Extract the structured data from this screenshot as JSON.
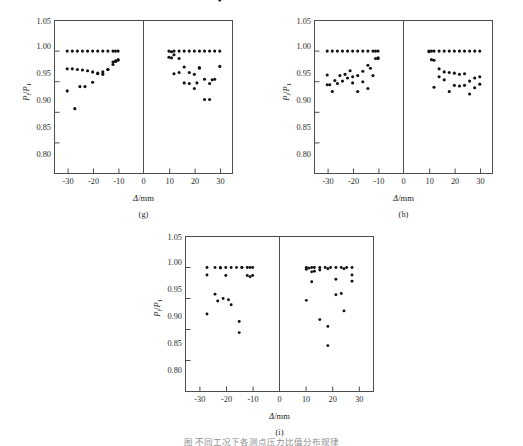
{
  "figure": {
    "panel_count": 3,
    "caption_partial": "图   不同工况下各测点压力比值分布规律"
  },
  "axes": {
    "ylabel": "P i / P 1",
    "ylabel_main": "P",
    "ylabel_sub_i": "i",
    "ylabel_den": "P",
    "ylabel_sub_1": "1",
    "xlabel_symbol": "Δ",
    "xlabel_unit": "/mm",
    "yticks": [
      "1.05",
      "1.00",
      "0.95",
      "0.90",
      "0.85",
      "0.80"
    ],
    "ytick_values": [
      1.05,
      1.0,
      0.95,
      0.9,
      0.85,
      0.8
    ],
    "xticks": [
      "-30",
      "-20",
      "-10",
      "0",
      "10",
      "20",
      "30"
    ],
    "xtick_values": [
      -30,
      -20,
      -10,
      0,
      10,
      20,
      30
    ],
    "ylim": [
      0.8,
      1.05
    ],
    "xlim": [
      -35,
      35
    ],
    "marker_color": "#111111",
    "frame_color": "#4d4d4d"
  },
  "chart_data": [
    {
      "type": "scatter",
      "panel": "(g)",
      "title": "",
      "xlabel": "Δ/mm",
      "ylabel": "Pi/P1",
      "xlim": [
        -35,
        35
      ],
      "ylim": [
        0.8,
        1.05
      ],
      "grid": false,
      "legend": "none",
      "x": [
        -30,
        -28,
        -26,
        -24,
        -22,
        -20,
        -18,
        -16,
        -14,
        -12,
        -11,
        -10,
        -30,
        -28,
        -26,
        -24,
        -22,
        -20,
        -18,
        -16,
        -14,
        -12,
        -11,
        -10,
        -30,
        -27,
        -25,
        -23,
        -20,
        -18,
        -16,
        -14,
        -12,
        -11,
        -10,
        10,
        11,
        12,
        14,
        16,
        18,
        20,
        22,
        24,
        26,
        28,
        30,
        10,
        11,
        12,
        14,
        16,
        18,
        20,
        22,
        24,
        26,
        28,
        30,
        12,
        14,
        16,
        18,
        20,
        21,
        22,
        24,
        26,
        27,
        30
      ],
      "y": [
        1.0,
        1.0,
        1.0,
        1.0,
        1.0,
        1.0,
        1.0,
        1.0,
        1.0,
        1.0,
        1.0,
        1.0,
        0.971,
        0.971,
        0.97,
        0.969,
        0.968,
        0.966,
        0.964,
        0.966,
        0.97,
        0.978,
        0.983,
        0.985,
        0.935,
        0.906,
        0.942,
        0.942,
        0.949,
        0.963,
        0.962,
        0.97,
        0.982,
        0.984,
        0.986,
        1.0,
        0.999,
        1.0,
        1.0,
        1.0,
        1.0,
        1.0,
        1.0,
        1.0,
        1.0,
        1.0,
        1.0,
        0.99,
        0.989,
        0.994,
        0.988,
        0.974,
        0.965,
        0.962,
        0.972,
        0.954,
        0.947,
        0.954,
        0.975,
        0.963,
        0.965,
        0.948,
        0.947,
        0.939,
        0.948,
        0.973,
        0.921,
        0.921,
        0.953
      ],
      "series_note": "three overlapping point bands per side"
    },
    {
      "type": "scatter",
      "panel": "(h)",
      "title": "",
      "xlabel": "Δ/mm",
      "ylabel": "Pi/P1",
      "xlim": [
        -35,
        35
      ],
      "ylim": [
        0.8,
        1.05
      ],
      "grid": false,
      "legend": "none",
      "x": [
        -30,
        -28,
        -26,
        -24,
        -22,
        -20,
        -18,
        -16,
        -14,
        -12,
        -11,
        -10,
        -30,
        -29,
        -27,
        -25,
        -23,
        -21,
        -20,
        -18,
        -16,
        -14,
        -13,
        -11,
        -10,
        -30,
        -28,
        -26,
        -24,
        -22,
        -20,
        -18,
        -16,
        -14,
        -12,
        -10,
        10,
        11,
        12,
        14,
        16,
        18,
        20,
        22,
        24,
        26,
        28,
        30,
        10,
        11,
        12,
        14,
        16,
        18,
        20,
        22,
        24,
        26,
        28,
        30,
        12,
        14,
        16,
        18,
        20,
        22,
        24,
        26,
        28,
        30
      ],
      "y": [
        1.0,
        1.0,
        1.0,
        1.0,
        1.0,
        1.0,
        1.0,
        1.0,
        1.0,
        1.0,
        1.0,
        1.0,
        0.961,
        0.945,
        0.952,
        0.96,
        0.962,
        0.968,
        0.958,
        0.96,
        0.967,
        0.977,
        0.972,
        0.988,
        0.989,
        0.945,
        0.934,
        0.947,
        0.951,
        0.956,
        0.948,
        0.934,
        0.95,
        0.939,
        0.96,
        0.988,
        1.0,
        1.0,
        1.0,
        1.0,
        1.0,
        1.0,
        1.0,
        1.0,
        1.0,
        1.0,
        1.0,
        1.0,
        0.999,
        0.986,
        0.985,
        0.971,
        0.966,
        0.965,
        0.964,
        0.962,
        0.963,
        0.951,
        0.956,
        0.958,
        0.941,
        0.958,
        0.953,
        0.934,
        0.944,
        0.943,
        0.944,
        0.93,
        0.94,
        0.946
      ],
      "series_note": "three overlapping point bands per side"
    },
    {
      "type": "scatter",
      "panel": "(i)",
      "title": "",
      "xlabel": "Δ/mm",
      "ylabel": "Pi/P1",
      "xlim": [
        -35,
        35
      ],
      "ylim": [
        0.8,
        1.05
      ],
      "grid": false,
      "legend": "none",
      "x": [
        -27,
        -24,
        -22,
        -20,
        -18,
        -16,
        -14,
        -12,
        -11,
        -10,
        -27,
        -22,
        -20,
        -14,
        -12,
        -11,
        -10,
        -27,
        -24,
        -23,
        -21,
        -19,
        -18,
        -15,
        -15,
        10,
        11,
        12,
        13,
        15,
        17,
        19,
        21,
        23,
        25,
        27,
        10,
        12,
        13,
        15,
        18,
        21,
        24,
        27,
        10,
        12,
        15,
        18,
        18,
        21,
        23,
        24,
        27
      ],
      "y": [
        1.0,
        1.0,
        1.0,
        1.0,
        1.0,
        1.0,
        1.0,
        1.0,
        1.0,
        1.0,
        0.988,
        0.999,
        0.987,
        1.0,
        0.987,
        0.985,
        0.987,
        0.925,
        0.957,
        0.946,
        0.95,
        0.948,
        0.94,
        0.913,
        0.895,
        1.0,
        0.999,
        1.0,
        1.0,
        1.0,
        1.0,
        1.0,
        1.0,
        1.0,
        1.0,
        1.0,
        0.997,
        0.993,
        0.994,
        0.996,
        0.998,
        0.981,
        0.998,
        0.988,
        0.947,
        0.977,
        0.916,
        0.905,
        0.874,
        0.956,
        0.958,
        0.93,
        0.978
      ],
      "series_note": "three overlapping point bands per side"
    }
  ]
}
